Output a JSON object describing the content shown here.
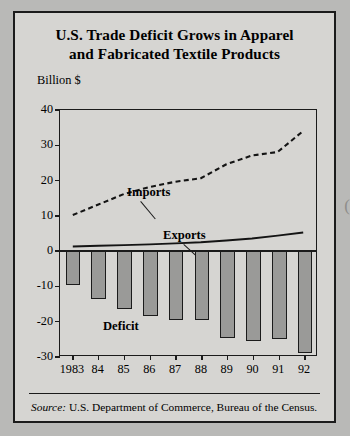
{
  "figure": {
    "title_line1": "U.S. Trade Deficit Grows in Apparel",
    "title_line2": "and Fabricated Textile Products",
    "unit_label": "Billion $",
    "source_prefix": "Source:",
    "source_text": "U.S. Department of Commerce, Bureau of the Census."
  },
  "annotations": {
    "imports": "Imports",
    "exports": "Exports",
    "deficit": "Deficit"
  },
  "chart_data": {
    "type": "bar",
    "title": "U.S. Trade Deficit Grows in Apparel and Fabricated Textile Products",
    "xlabel": "",
    "ylabel": "Billion $",
    "ylim": [
      -30,
      40
    ],
    "ytick_values": [
      40,
      30,
      20,
      10,
      0,
      -10,
      -20,
      -30
    ],
    "ytick_labels": [
      "40",
      "30",
      "20",
      "10",
      "0",
      "-10",
      "-20",
      "-30"
    ],
    "grid": false,
    "legend": "inline annotations",
    "categories": [
      "1983",
      "84",
      "85",
      "86",
      "87",
      "88",
      "89",
      "90",
      "91",
      "92"
    ],
    "xtick_labels": [
      "1983",
      "84",
      "85",
      "86",
      "87",
      "88",
      "89",
      "90",
      "91",
      "92"
    ],
    "series": [
      {
        "name": "Imports",
        "type": "line",
        "style": "dashed",
        "values": [
          10,
          13,
          16,
          18,
          19.5,
          20.5,
          24.5,
          27,
          28,
          34
        ]
      },
      {
        "name": "Exports",
        "type": "line",
        "style": "solid",
        "values": [
          1,
          1.2,
          1.4,
          1.6,
          1.9,
          2.2,
          2.7,
          3.3,
          4.1,
          5
        ]
      },
      {
        "name": "Deficit",
        "type": "bar",
        "values": [
          -9.5,
          -13.5,
          -16.5,
          -18.5,
          -19.5,
          -19.5,
          -24.5,
          -25.5,
          -25,
          -29
        ]
      }
    ]
  }
}
